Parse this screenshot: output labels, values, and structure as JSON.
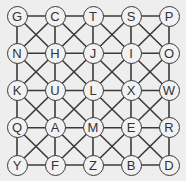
{
  "puzzle": {
    "rows": 5,
    "cols": 5,
    "origin": [
      17,
      16
    ],
    "spacing": [
      38,
      37.25
    ],
    "node_radius": 10.5,
    "line_color": "#3a3a3a",
    "background": "#eeeeee",
    "diagonals": "all",
    "grid": [
      [
        "G",
        "C",
        "T",
        "S",
        "P"
      ],
      [
        "N",
        "H",
        "J",
        "I",
        "O"
      ],
      [
        "K",
        "U",
        "L",
        "X",
        "W"
      ],
      [
        "Q",
        "A",
        "M",
        "E",
        "R"
      ],
      [
        "Y",
        "F",
        "Z",
        "B",
        "D"
      ]
    ]
  }
}
